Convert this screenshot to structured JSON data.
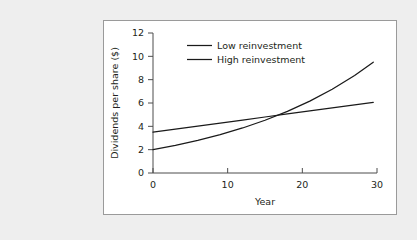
{
  "figure": {
    "panel_background": "#ffffff",
    "page_background": "#eeeeee",
    "border_color": "#9a9a9a"
  },
  "chart_data": {
    "type": "line",
    "title": "",
    "subtitle": "",
    "xlabel": "Year",
    "ylabel": "Dividends per share ($)",
    "xlim": [
      0,
      30
    ],
    "ylim": [
      0,
      12
    ],
    "xticks": [
      0,
      10,
      20,
      30
    ],
    "yticks": [
      0,
      2,
      4,
      6,
      8,
      10,
      12
    ],
    "xtick_labels": [
      "0",
      "10",
      "20",
      "30"
    ],
    "ytick_labels": [
      "0",
      "2",
      "4",
      "6",
      "8",
      "10",
      "12"
    ],
    "grid": false,
    "legend_position": "upper-center-inside",
    "line_color": "#1a1a1a",
    "annotations": [],
    "x": [
      0,
      3,
      6,
      9,
      12,
      15,
      18,
      21,
      24,
      27,
      29.5
    ],
    "series": [
      {
        "name": "Low reinvestment",
        "values": [
          3.5,
          3.76,
          4.02,
          4.28,
          4.54,
          4.8,
          5.06,
          5.32,
          5.58,
          5.84,
          6.05
        ]
      },
      {
        "name": "High reinvestment",
        "values": [
          2.0,
          2.37,
          2.8,
          3.29,
          3.86,
          4.52,
          5.28,
          6.16,
          7.18,
          8.36,
          9.5
        ]
      }
    ]
  },
  "legend": {
    "entries": [
      {
        "label": "Low reinvestment"
      },
      {
        "label": "High reinvestment"
      }
    ]
  }
}
